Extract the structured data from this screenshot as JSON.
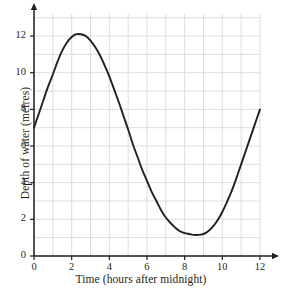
{
  "chart_data": {
    "type": "line",
    "title": "",
    "xlabel": "Time (hours after midnight)",
    "ylabel": "Depth of water (metres)",
    "xlim": [
      0,
      12
    ],
    "ylim": [
      0,
      13.2
    ],
    "xticks": [
      0,
      2,
      4,
      6,
      8,
      10,
      12
    ],
    "xtick_labels": [
      "0",
      "2",
      "4",
      "6",
      "8",
      "10",
      "12"
    ],
    "yticks": [
      0,
      2,
      4,
      6,
      8,
      10,
      12
    ],
    "ytick_labels": [
      "0",
      "2",
      "4",
      "6",
      "8",
      "10",
      "12"
    ],
    "grid": true,
    "grid_x_step": 1,
    "grid_y_step": 1,
    "legend": "none",
    "series": [
      {
        "name": "Depth of water",
        "color": "#231f20",
        "x": [
          0,
          0.25,
          0.5,
          0.75,
          1,
          1.25,
          1.5,
          1.75,
          2,
          2.25,
          2.5,
          2.75,
          3,
          3.25,
          3.5,
          3.75,
          4,
          4.25,
          4.5,
          4.75,
          5,
          5.25,
          5.5,
          5.75,
          6,
          6.25,
          6.5,
          6.75,
          7,
          7.25,
          7.5,
          7.75,
          8,
          8.25,
          8.5,
          8.75,
          9,
          9.25,
          9.5,
          9.75,
          10,
          10.25,
          10.5,
          10.75,
          11,
          11.25,
          11.5,
          11.75,
          12
        ],
        "y": [
          7.0,
          7.75,
          8.5,
          9.25,
          9.9,
          10.6,
          11.2,
          11.65,
          11.95,
          12.1,
          12.1,
          12.0,
          11.75,
          11.4,
          10.95,
          10.4,
          9.8,
          9.1,
          8.4,
          7.65,
          6.9,
          6.1,
          5.4,
          4.7,
          4.1,
          3.5,
          3.0,
          2.5,
          2.1,
          1.8,
          1.55,
          1.35,
          1.25,
          1.2,
          1.15,
          1.15,
          1.2,
          1.35,
          1.6,
          1.95,
          2.4,
          2.95,
          3.55,
          4.25,
          5.0,
          5.75,
          6.5,
          7.25,
          8.0
        ]
      }
    ],
    "annotations": {
      "maximum": {
        "x": 2.4,
        "y": 12.1
      },
      "minimum": {
        "x": 8.8,
        "y": 1.15
      },
      "start": {
        "x": 0,
        "y": 7.0
      },
      "end": {
        "x": 12,
        "y": 8.0
      }
    },
    "colors": {
      "curve": "#231f20",
      "axis": "#231f20",
      "grid": "#d9d9de",
      "background": "#ffffff",
      "text": "#231f20"
    }
  }
}
